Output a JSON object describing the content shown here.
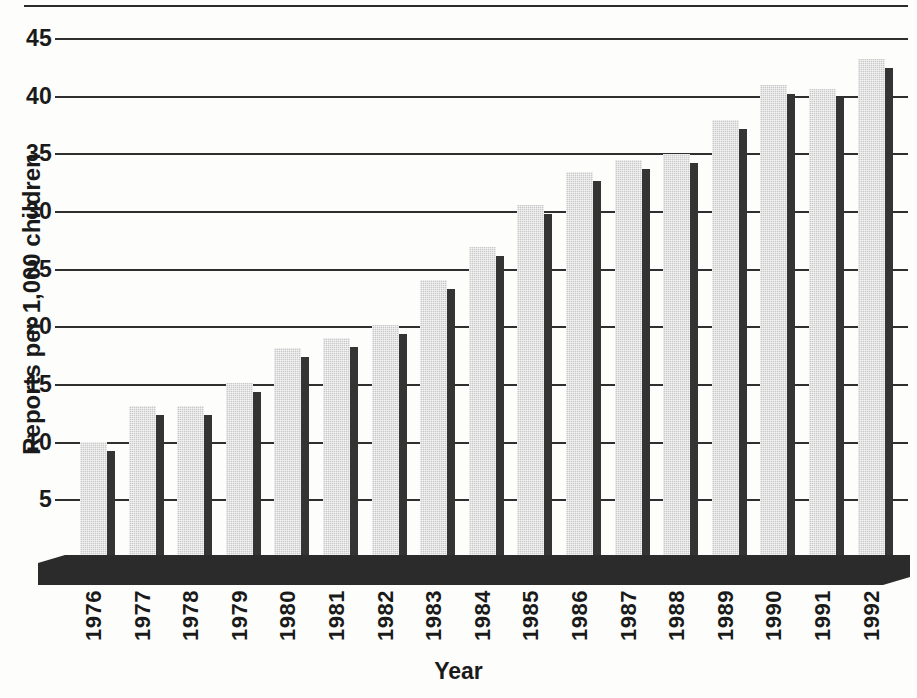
{
  "chart_data": {
    "type": "bar",
    "title": "",
    "xlabel": "Year",
    "ylabel": "Reports per 1,000 children",
    "categories": [
      "1976",
      "1977",
      "1978",
      "1979",
      "1980",
      "1981",
      "1982",
      "1983",
      "1984",
      "1985",
      "1986",
      "1987",
      "1988",
      "1989",
      "1990",
      "1991",
      "1992"
    ],
    "values": [
      10.0,
      13.1,
      13.1,
      15.1,
      18.1,
      19.0,
      20.1,
      24.0,
      26.9,
      30.5,
      33.4,
      34.4,
      34.9,
      37.9,
      40.9,
      40.6,
      43.2
    ],
    "ylim": [
      0,
      46
    ],
    "yticks": [
      5,
      10,
      15,
      20,
      25,
      30,
      35,
      40,
      45
    ],
    "ytick_labels": [
      "5",
      "10",
      "15",
      "20",
      "25",
      "30",
      "35",
      "40",
      "45"
    ],
    "grid": true,
    "legend": "none",
    "series_name": "Reports per 1,000 children",
    "colors": {
      "bar_face": "#c9c9c9",
      "bar_side": "#343434",
      "gridline": "#2f2f2f",
      "base": "#2b2b2b",
      "text": "#1a1a1a",
      "background": "#fdfdfb"
    }
  }
}
